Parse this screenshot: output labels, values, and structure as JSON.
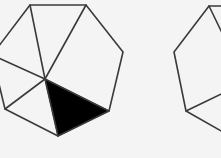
{
  "figure": {
    "colors": {
      "background": "#f4f4f4",
      "stroke": "#3a3a3a",
      "shaded_fill": "#000000"
    },
    "left_octagon": {
      "vertices": [
        [
          30,
          5
        ],
        [
          86,
          5
        ],
        [
          123,
          52
        ],
        [
          109,
          111
        ],
        [
          58,
          136
        ],
        [
          5,
          109
        ],
        [
          -8,
          55
        ]
      ],
      "center": [
        45,
        79
      ],
      "shaded_triangle": [
        [
          45,
          79
        ],
        [
          109,
          111
        ],
        [
          58,
          136
        ]
      ]
    },
    "right_octagon": {
      "vertices": [
        [
          209,
          6
        ],
        [
          174,
          52
        ],
        [
          186,
          111
        ],
        [
          230,
          136
        ]
      ],
      "cropped": true
    }
  }
}
